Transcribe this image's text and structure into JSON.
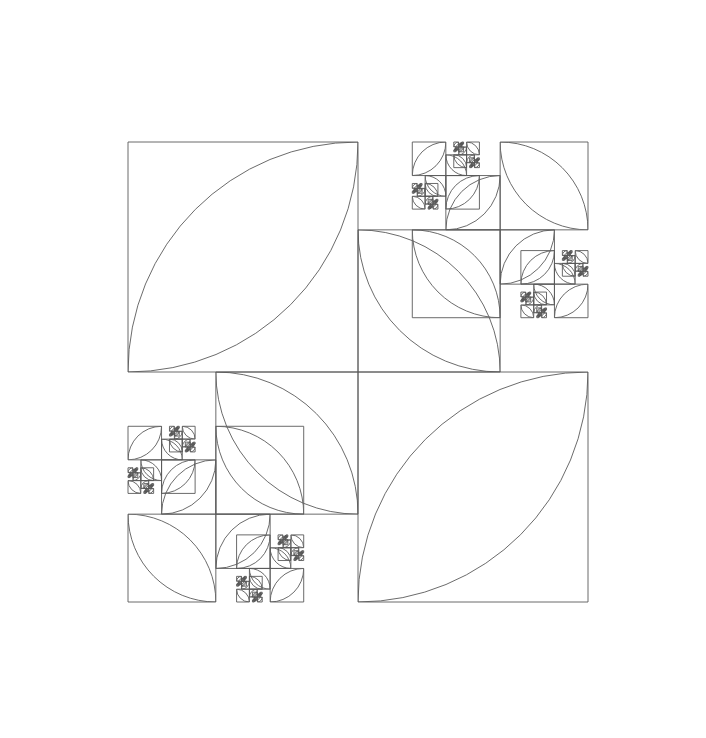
{
  "document": {
    "title": "Golden Ratio Leaf Fractal",
    "width": 706,
    "height": 738,
    "background_color": "#ffffff"
  },
  "figure": {
    "name": "recursive-vesica-pinwheel",
    "stroke_color": "#5a5a5a",
    "stroke_width": 0.9,
    "fill": "none"
  },
  "chart_data": {
    "type": "diagram",
    "xlabel": "",
    "ylabel": "",
    "grid": false,
    "legend": null,
    "xlim": [
      0,
      706
    ],
    "ylim": [
      0,
      738
    ],
    "geometry": {
      "primitive": "square-with-two-quarter-arc-leaf",
      "cluster_layout": "four-fold pinwheel about a shared center",
      "scale_ratio": 0.382,
      "scale_ratio_label": "1/phi^2",
      "phi": 1.618034,
      "max_depth": 6,
      "root_center": [
        358,
        372
      ],
      "root_half_size": 230,
      "quadrant_order": [
        "NW",
        "NE",
        "SE",
        "SW"
      ],
      "child_corner_sequence": [
        "NE",
        "SE",
        "SW",
        "NW"
      ],
      "bounds_observed": {
        "left": 39,
        "top": 42,
        "right": 690,
        "bottom": 691
      },
      "measured_squares": [
        {
          "label": "main-NW",
          "x": 128,
          "y": 139,
          "size": 230
        },
        {
          "label": "main-NE",
          "x": 358,
          "y": 236,
          "size": 133
        },
        {
          "label": "main-SE",
          "x": 358,
          "y": 372,
          "size": 230
        },
        {
          "label": "main-SW",
          "x": 225,
          "y": 372,
          "size": 133
        },
        {
          "label": "gen2-top",
          "x": 324,
          "y": 42,
          "size": 88
        },
        {
          "label": "gen2-left",
          "x": 39,
          "y": 341,
          "size": 88
        }
      ]
    }
  }
}
